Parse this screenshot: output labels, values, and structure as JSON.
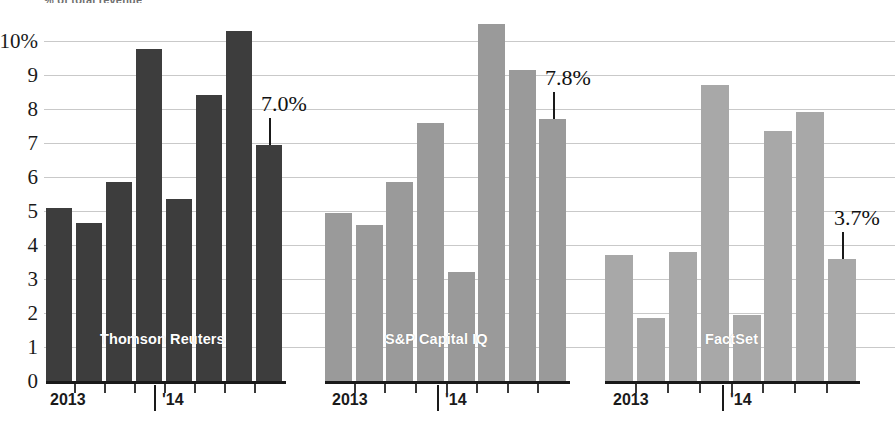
{
  "kicker": "% of total revenue",
  "chart_data": {
    "type": "bar",
    "title": "",
    "xlabel": "",
    "ylabel": "",
    "ylim": [
      0,
      10.6
    ],
    "grid": true,
    "legend_position": "in-panel",
    "y_ticks": [
      "0",
      "1",
      "2",
      "3",
      "4",
      "5",
      "6",
      "7",
      "8",
      "9",
      "10%"
    ],
    "y_tick_values": [
      0,
      1,
      2,
      3,
      4,
      5,
      6,
      7,
      8,
      9,
      10
    ],
    "categories": [
      "Q1 2013",
      "Q2 2013",
      "Q3 2013",
      "Q4 2013",
      "Q1 '14",
      "Q2 '14",
      "Q3 '14",
      "Q4 '14"
    ],
    "x_tick_labels": [
      "2013",
      "'14"
    ],
    "panels": [
      {
        "name": "Thomson Reuters",
        "color": "#3d3d3d",
        "values": [
          5.1,
          4.65,
          5.85,
          9.75,
          5.35,
          8.4,
          10.3,
          6.95
        ],
        "callout": "7.0%",
        "callout_index": 7
      },
      {
        "name": "S&P Capital IQ",
        "color": "#9a9a9a",
        "values": [
          4.95,
          4.6,
          5.85,
          7.6,
          3.2,
          10.5,
          9.15,
          7.7
        ],
        "callout": "7.8%",
        "callout_index": 7
      },
      {
        "name": "FactSet",
        "color": "#a8a8a8",
        "values": [
          3.7,
          1.85,
          3.8,
          8.7,
          1.95,
          7.35,
          7.9,
          3.6
        ],
        "callout": "3.7%",
        "callout_index": 7
      }
    ]
  }
}
